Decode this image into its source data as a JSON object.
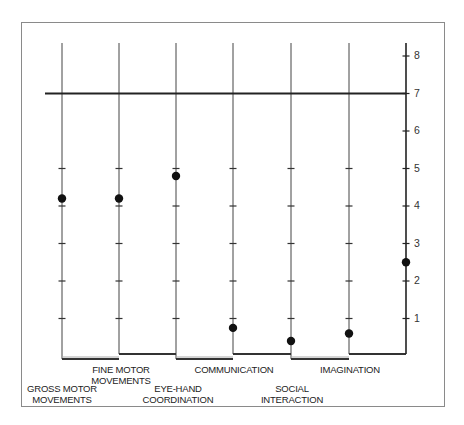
{
  "chart_data": {
    "type": "scatter",
    "title": "",
    "xlabel": "",
    "ylabel": "",
    "ylim": [
      0,
      8.3
    ],
    "yticks": [
      1,
      2,
      3,
      4,
      5,
      6,
      7,
      8
    ],
    "y_axis_position": "right",
    "grid": false,
    "reference_line": {
      "y": 7,
      "style": "solid-bold"
    },
    "categories": [
      "GROSS MOTOR MOVEMENTS",
      "FINE MOTOR MOVEMENTS",
      "EYE-HAND COORDINATION",
      "COMMUNICATION",
      "SOCIAL INTERACTION",
      "IMAGINATION"
    ],
    "points": [
      {
        "category": "GROSS MOTOR MOVEMENTS",
        "value": 4.2
      },
      {
        "category": "FINE MOTOR MOVEMENTS",
        "value": 4.2
      },
      {
        "category": "EYE-HAND COORDINATION",
        "value": 4.8
      },
      {
        "category": "COMMUNICATION",
        "value": 0.75
      },
      {
        "category": "SOCIAL INTERACTION",
        "value": 0.4
      },
      {
        "category": "IMAGINATION",
        "value": 0.6
      },
      {
        "category": "axis",
        "value": 2.5
      }
    ],
    "colors": {
      "line": "#222222",
      "dot": "#111111",
      "frame": "#888888"
    }
  },
  "labels": {
    "gross": [
      "GROSS MOTOR",
      "MOVEMENTS"
    ],
    "fine": [
      "FINE MOTOR",
      "MOVEMENTS"
    ],
    "eye": [
      "EYE-HAND",
      "COORDINATION"
    ],
    "comm": [
      "COMMUNICATION"
    ],
    "social": [
      "SOCIAL",
      "INTERACTION"
    ],
    "imag": [
      "IMAGINATION"
    ]
  },
  "ticks": [
    "1",
    "2",
    "3",
    "4",
    "5",
    "6",
    "7",
    "8"
  ]
}
